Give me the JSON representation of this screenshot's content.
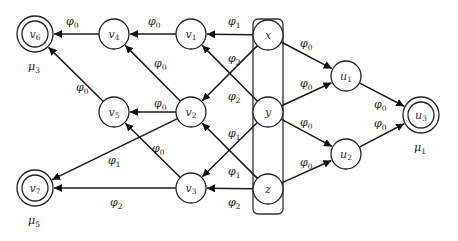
{
  "diagram": {
    "type": "directed-graph",
    "nodes": [
      {
        "id": "v6",
        "base": "v",
        "sub": "6",
        "x": 35,
        "y": 34,
        "accepting": true,
        "weight_label": {
          "base": "μ",
          "sub": "3"
        }
      },
      {
        "id": "v4",
        "base": "v",
        "sub": "4",
        "x": 114,
        "y": 34
      },
      {
        "id": "v1",
        "base": "v",
        "sub": "1",
        "x": 191,
        "y": 34
      },
      {
        "id": "x",
        "base": "x",
        "sub": "",
        "x": 268,
        "y": 35
      },
      {
        "id": "v5",
        "base": "v",
        "sub": "5",
        "x": 114,
        "y": 112
      },
      {
        "id": "v2",
        "base": "v",
        "sub": "2",
        "x": 191,
        "y": 112
      },
      {
        "id": "y",
        "base": "y",
        "sub": "",
        "x": 268,
        "y": 112
      },
      {
        "id": "v7",
        "base": "v",
        "sub": "7",
        "x": 35,
        "y": 188,
        "accepting": true,
        "weight_label": {
          "base": "μ",
          "sub": "5"
        }
      },
      {
        "id": "v3",
        "base": "v",
        "sub": "3",
        "x": 191,
        "y": 188
      },
      {
        "id": "z",
        "base": "z",
        "sub": "",
        "x": 268,
        "y": 189
      },
      {
        "id": "u1",
        "base": "u",
        "sub": "1",
        "x": 346,
        "y": 76
      },
      {
        "id": "u2",
        "base": "u",
        "sub": "2",
        "x": 346,
        "y": 154
      },
      {
        "id": "u3",
        "base": "u",
        "sub": "3",
        "x": 421,
        "y": 115,
        "accepting": true,
        "weight_label": {
          "base": "μ",
          "sub": "1"
        }
      }
    ],
    "group": {
      "members": [
        "x",
        "y",
        "z"
      ],
      "x": 253,
      "y": 19,
      "width": 30,
      "height": 195
    },
    "edges": [
      {
        "from": "v4",
        "to": "v6",
        "label": {
          "base": "φ",
          "sub": "0"
        },
        "lx": 66,
        "ly": 25
      },
      {
        "from": "v1",
        "to": "v4",
        "label": {
          "base": "φ",
          "sub": "0"
        },
        "lx": 148,
        "ly": 25
      },
      {
        "from": "x",
        "to": "v1",
        "label": {
          "base": "φ",
          "sub": "1"
        },
        "lx": 228,
        "ly": 25
      },
      {
        "from": "v5",
        "to": "v6",
        "label": {
          "base": "φ",
          "sub": "0"
        },
        "lx": 76,
        "ly": 91
      },
      {
        "from": "v2",
        "to": "v4",
        "label": {
          "base": "φ",
          "sub": "0"
        },
        "lx": 154,
        "ly": 67
      },
      {
        "from": "v2",
        "to": "v5",
        "label": {
          "base": "φ",
          "sub": "0"
        },
        "lx": 154,
        "ly": 107
      },
      {
        "from": "x",
        "to": "v2",
        "label": {
          "base": "φ",
          "sub": "2"
        },
        "lx": 228,
        "ly": 62
      },
      {
        "from": "y",
        "to": "v1",
        "label": {
          "base": "φ",
          "sub": "2"
        },
        "lx": 228,
        "ly": 100
      },
      {
        "from": "z",
        "to": "v2",
        "label": {
          "base": "φ",
          "sub": "1"
        },
        "lx": 228,
        "ly": 137
      },
      {
        "from": "y",
        "to": "v3",
        "label": {
          "base": "φ",
          "sub": "1"
        },
        "lx": 228,
        "ly": 175
      },
      {
        "from": "v2",
        "to": "v7",
        "label": {
          "base": "φ",
          "sub": "1"
        },
        "lx": 108,
        "ly": 164
      },
      {
        "from": "v3",
        "to": "v5",
        "label": {
          "base": "φ",
          "sub": "0"
        },
        "lx": 152,
        "ly": 152
      },
      {
        "from": "v3",
        "to": "v7",
        "label": {
          "base": "φ",
          "sub": "2"
        },
        "lx": 110,
        "ly": 206
      },
      {
        "from": "z",
        "to": "v3",
        "label": {
          "base": "φ",
          "sub": "2"
        },
        "lx": 228,
        "ly": 206
      },
      {
        "from": "x",
        "to": "u1",
        "label": {
          "base": "φ",
          "sub": "0"
        },
        "lx": 300,
        "ly": 47
      },
      {
        "from": "y",
        "to": "u1",
        "label": {
          "base": "φ",
          "sub": "0"
        },
        "lx": 300,
        "ly": 87
      },
      {
        "from": "y",
        "to": "u2",
        "label": {
          "base": "φ",
          "sub": "0"
        },
        "lx": 300,
        "ly": 126
      },
      {
        "from": "z",
        "to": "u2",
        "label": {
          "base": "φ",
          "sub": "0"
        },
        "lx": 300,
        "ly": 166
      },
      {
        "from": "u1",
        "to": "u3",
        "label": {
          "base": "φ",
          "sub": "0"
        },
        "lx": 374,
        "ly": 108
      },
      {
        "from": "u2",
        "to": "u3",
        "label": {
          "base": "φ",
          "sub": "0"
        },
        "lx": 374,
        "ly": 127
      }
    ]
  }
}
